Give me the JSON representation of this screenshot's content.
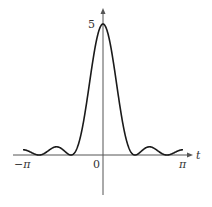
{
  "chart_data": {
    "type": "line",
    "title": "",
    "xlabel": "t",
    "ylabel": "",
    "function": "Fejer kernel F_5(t) = (1/5) * (sin(5t/2) / sin(t/2))^2",
    "xlim": [
      -3.14159,
      3.14159
    ],
    "ylim": [
      0,
      5
    ],
    "x_tick_labels": [
      "-π",
      "0",
      "π"
    ],
    "y_tick_labels": [
      "5"
    ],
    "peak": {
      "x": 0,
      "y": 5
    },
    "zeros": [
      -2.5133,
      -1.2566,
      1.2566,
      2.5133
    ],
    "series": [
      {
        "name": "F_5(t)",
        "x": [
          -3.1416,
          -2.8274,
          -2.5133,
          -2.1991,
          -1.885,
          -1.5708,
          -1.2566,
          -0.9425,
          -0.6283,
          -0.3142,
          0,
          0.3142,
          0.6283,
          0.9425,
          1.2566,
          1.5708,
          1.885,
          2.1991,
          2.5133,
          2.8274,
          3.1416
        ],
        "values": [
          0.2,
          0.11,
          0,
          0.15,
          0.28,
          0.2,
          0,
          0.43,
          1.81,
          3.67,
          5,
          3.67,
          1.81,
          0.43,
          0,
          0.2,
          0.28,
          0.15,
          0,
          0.11,
          0.2
        ]
      }
    ],
    "grid": false,
    "legend": null
  },
  "labels": {
    "x_axis": "t",
    "neg_pi": "−π",
    "zero": "0",
    "pi": "π",
    "peak": "5"
  },
  "colors": {
    "curve": "#1a1a1a",
    "axis": "#555555",
    "text": "#333333"
  }
}
